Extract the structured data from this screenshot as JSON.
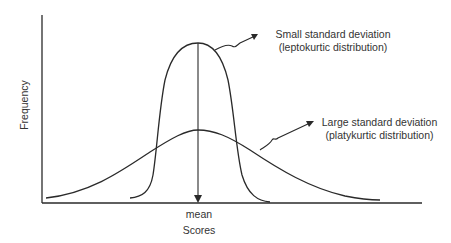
{
  "diagram": {
    "title": "",
    "y_axis_label": "Frequency",
    "x_axis_label": "Scores",
    "mean_label": "mean",
    "annotations": {
      "small_sd": {
        "line1": "Small standard deviation",
        "line2": "(leptokurtic distribution)"
      },
      "large_sd": {
        "line1": "Large standard deviation",
        "line2": "(platykurtic distribution)"
      }
    },
    "curves": [
      {
        "name": "leptokurtic",
        "description": "tall narrow bell curve",
        "peak_x": 198,
        "peak_y": 43
      },
      {
        "name": "platykurtic",
        "description": "short wide bell curve",
        "peak_x": 198,
        "peak_y": 130
      }
    ],
    "line_color": "#2a2a2a"
  }
}
